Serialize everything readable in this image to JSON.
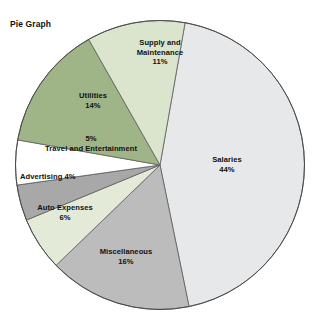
{
  "chart_data": {
    "type": "pie",
    "title": "Pie Graph",
    "xlabel": "",
    "ylabel": "",
    "legend_position": "none",
    "grid": false,
    "categories": [
      "Salaries",
      "Miscellaneous",
      "Auto Expenses",
      "Advertising",
      "Travel and Entertainment",
      "Utilities",
      "Supply and Maintenance"
    ],
    "values": [
      44,
      16,
      6,
      4,
      5,
      14,
      11
    ],
    "unit": "%",
    "colors": [
      "#e7e8e9",
      "#bcbcbc",
      "#e3ead8",
      "#a8a8a8",
      "#ffffff",
      "#9fb587",
      "#dbe5cd"
    ],
    "slices": [
      {
        "name": "Salaries",
        "value": 44,
        "value_label": "44%",
        "color": "#e7e8e9",
        "start_angle": 10,
        "end_angle": 168.4
      },
      {
        "name": "Miscellaneous",
        "value": 16,
        "value_label": "16%",
        "color": "#bcbcbc",
        "start_angle": 168.4,
        "end_angle": 226
      },
      {
        "name": "Auto Expenses",
        "value": 6,
        "value_label": "6%",
        "color": "#e3ead8",
        "start_angle": 226,
        "end_angle": 247.6
      },
      {
        "name": "Advertising",
        "value": 4,
        "value_label": "4%",
        "color": "#a8a8a8",
        "start_angle": 247.6,
        "end_angle": 262
      },
      {
        "name": "Travel and Entertainment",
        "value": 5,
        "value_label": "5%",
        "color": "#ffffff",
        "start_angle": 262,
        "end_angle": 280
      },
      {
        "name": "Utilities",
        "value": 14,
        "value_label": "14%",
        "color": "#9fb587",
        "start_angle": 280,
        "end_angle": 330.4
      },
      {
        "name": "Supply and Maintenance",
        "value": 11,
        "value_label": "11%",
        "color": "#dbe5cd",
        "start_angle": 330.4,
        "end_angle": 370
      }
    ]
  },
  "labels": {
    "salaries_name": "Salaries",
    "salaries_pct": "44%",
    "miscellaneous_name": "Miscellaneous",
    "miscellaneous_pct": "16%",
    "auto_expenses_name": "Auto Expenses",
    "auto_expenses_pct": "6%",
    "advertising_combined": "Advertising 4%",
    "travel_pct": "5%",
    "travel_name": "Travel and Entertainment",
    "utilities_name": "Utilities",
    "utilities_pct": "14%",
    "supply_name_line1": "Supply and",
    "supply_name_line2": "Maintenance",
    "supply_pct": "11%"
  }
}
